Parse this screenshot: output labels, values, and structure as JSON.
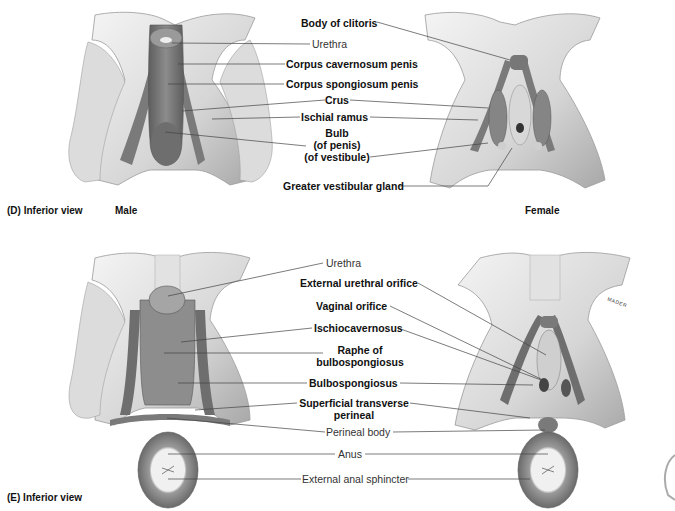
{
  "panel_d": {
    "caption": "(D) Inferior view",
    "male_label": "Male",
    "female_label": "Female",
    "labels": {
      "body_of_clitoris": "Body of clitoris",
      "urethra": "Urethra",
      "corpus_cavernosum": "Corpus cavernosum penis",
      "corpus_spongiosum": "Corpus spongiosum penis",
      "crus": "Crus",
      "ischial_ramus": "Ischial ramus",
      "bulb_line1": "Bulb",
      "bulb_line2": "(of penis)",
      "bulb_line3": "(of vestibule)",
      "greater_vestibular_gland": "Greater vestibular gland"
    }
  },
  "panel_e": {
    "caption": "(E) Inferior view",
    "signature": "MADER",
    "labels": {
      "urethra": "Urethra",
      "external_urethral_orifice": "External urethral orifice",
      "vaginal_orifice": "Vaginal orifice",
      "ischiocavernosus": "Ischiocavernosus",
      "raphe_line1": "Raphe of",
      "raphe_line2": "bulbospongiosus",
      "bulbospongiosus": "Bulbospongiosus",
      "superficial_line1": "Superficial transverse",
      "superficial_line2": "perineal",
      "perineal_body": "Perineal body",
      "anus": "Anus",
      "external_anal_sphincter": "External anal sphincter"
    }
  },
  "colors": {
    "bone_light": "#e6e6e6",
    "bone_mid": "#c8c8c8",
    "bone_shadow": "#9a9a9a",
    "tissue_dark": "#6e6e6e",
    "tissue_mid": "#8a8a8a",
    "leader_line": "#444444"
  }
}
